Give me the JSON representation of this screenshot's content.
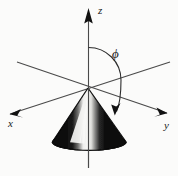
{
  "figure": {
    "kind": "3d-coordinate-diagram",
    "background_color": "#fbfbfa",
    "line_color": "#4a4a4a",
    "ink_color": "#111111"
  },
  "axes": [
    {
      "id": "z",
      "label": "z",
      "label_x": 98,
      "label_y": 14,
      "direction": "up",
      "has_arrow": true
    },
    {
      "id": "x",
      "label": "x",
      "label_x": 8,
      "label_y": 127,
      "direction": "down-left",
      "has_arrow": true
    },
    {
      "id": "y",
      "label": "y",
      "label_x": 164,
      "label_y": 129,
      "direction": "down-right",
      "has_arrow": true
    }
  ],
  "angle": {
    "symbol": "ϕ",
    "label_x": 112,
    "label_y": 58,
    "measured_from": "z",
    "measured_to": "cone-surface",
    "has_arrow": true
  },
  "cone": {
    "apex_x": 88,
    "apex_y": 88,
    "base_center_x": 89,
    "base_center_y": 142,
    "base_rx": 37,
    "base_ry": 9,
    "fill_color": "#0a0a0a",
    "highlight_color": "#f2f2f0"
  },
  "origin": {
    "x": 88,
    "y": 88
  }
}
